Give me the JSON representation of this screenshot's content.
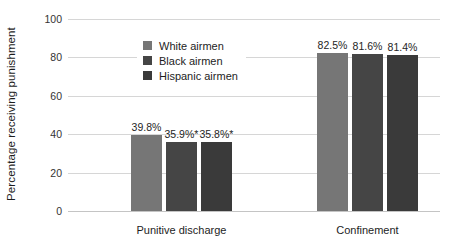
{
  "chart_data": {
    "type": "bar",
    "title": "",
    "xlabel": "",
    "ylabel": "Percentage receiving punishment",
    "ylim": [
      0,
      100
    ],
    "yticks": [
      0,
      20,
      40,
      60,
      80,
      100
    ],
    "ytick_labels": [
      "0",
      "20",
      "40",
      "60",
      "80",
      "100"
    ],
    "grid": true,
    "legend_position": "upper center",
    "categories": [
      "Punitive discharge",
      "Confinement"
    ],
    "series": [
      {
        "name": "White airmen",
        "color": "#767676",
        "values": [
          39.8,
          82.5
        ],
        "labels": [
          "39.8%",
          "82.5%"
        ]
      },
      {
        "name": "Black airmen",
        "color": "#454545",
        "values": [
          35.9,
          81.6
        ],
        "labels": [
          "35.9%*",
          "81.6%"
        ]
      },
      {
        "name": "Hispanic airmen",
        "color": "#3a3a3a",
        "values": [
          35.8,
          81.4
        ],
        "labels": [
          "35.8%*",
          "81.4%"
        ]
      }
    ],
    "annotations": [
      "* denotes statistically significant difference"
    ]
  },
  "colors": {
    "background": "#ffffff",
    "gridline": "#d6d6d6",
    "baseline": "#c4c4c4",
    "text": "#1d1d1d"
  }
}
